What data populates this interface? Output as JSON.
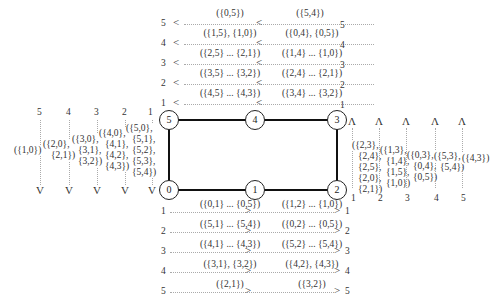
{
  "nodes": {
    "n0": "0",
    "n1": "1",
    "n2": "2",
    "n3": "3",
    "n4": "4",
    "n5": "5"
  },
  "top": {
    "levels": [
      "5",
      "4",
      "3",
      "2",
      "1"
    ],
    "left_labels": [
      "({0,5})",
      "({1,5}, {1,0})",
      "({2,5} ... {2,1})",
      "({3,5} ... {3,2})",
      "({4,5} ... {4,3})"
    ],
    "right_labels": [
      "({5,4})",
      "({0,4}, {0,5})",
      "({1,4} ... {1,0})",
      "({2,4} ... {2,1})",
      "({3,4} ... {3,2})"
    ],
    "arrow": "<"
  },
  "bottom": {
    "levels": [
      "1",
      "2",
      "3",
      "4",
      "5"
    ],
    "left_labels": [
      "({0,1} ... {0,5})",
      "({5,1} ... {5,4})",
      "({4,1} ... {4,3})",
      "({3,1}, {3,2})",
      "({2,1})"
    ],
    "right_labels": [
      "({1,2} ... {1,0})",
      "({0,2} ... {0,5})",
      "({5,2} ... {5,4})",
      "({4,2}, {4,3})",
      "({3,2})"
    ],
    "arrow": ">"
  },
  "left": {
    "levels": [
      "5",
      "4",
      "3",
      "2",
      "1"
    ],
    "labels": [
      [
        "({1,0})"
      ],
      [
        "({2,0},",
        "{2,1})"
      ],
      [
        "({3,0},",
        "{3,1},",
        "{3,2})"
      ],
      [
        "({4,0},",
        "{4,1},",
        "{4,2},",
        "{4,3})"
      ],
      [
        "({5,0},",
        "{5,1},",
        "{5,2},",
        "{5,3},",
        "{5,4})"
      ]
    ],
    "arrow": "V"
  },
  "right": {
    "levels": [
      "1",
      "2",
      "3",
      "4",
      "5"
    ],
    "labels": [
      [
        "({2,3},",
        "{2,4},",
        "{2,5},",
        "{2,0},",
        "{2,1})"
      ],
      [
        "({1,3},",
        "{1,4},",
        "{1,5},",
        "{1,0})"
      ],
      [
        "({0,3},",
        "{0,4},",
        "{0,5})"
      ],
      [
        "({5,3},",
        "{5,4})"
      ],
      [
        "({4,3})"
      ]
    ],
    "arrow": "Λ"
  }
}
